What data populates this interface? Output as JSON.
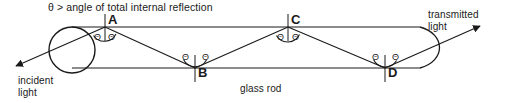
{
  "figure": {
    "title_caption": "θ > angle of total internal reflection",
    "labels": {
      "incident_line1": "incident",
      "incident_line2": "light",
      "transmitted_line1": "transmitted",
      "transmitted_line2": "light",
      "glass_rod": "glass rod"
    },
    "points": [
      {
        "id": "A",
        "label": "A",
        "x": 105,
        "y": 27,
        "surface": "top"
      },
      {
        "id": "B",
        "label": "B",
        "x": 195,
        "y": 68,
        "surface": "bottom"
      },
      {
        "id": "C",
        "label": "C",
        "x": 288,
        "y": 27,
        "surface": "top"
      },
      {
        "id": "D",
        "label": "D",
        "x": 385,
        "y": 68,
        "surface": "bottom"
      }
    ],
    "angle_symbol": "Θ",
    "angle_marks": [
      {
        "at": "A",
        "side": "left"
      },
      {
        "at": "A",
        "side": "right"
      },
      {
        "at": "B",
        "side": "left"
      },
      {
        "at": "B",
        "side": "right"
      },
      {
        "at": "C",
        "side": "left"
      },
      {
        "at": "C",
        "side": "right"
      },
      {
        "at": "D",
        "side": "left"
      },
      {
        "at": "D",
        "side": "right"
      }
    ],
    "colors": {
      "stroke": "#1a1a1a",
      "background": "#ffffff",
      "text": "#1a1a1a"
    },
    "rod": {
      "top_y": 27,
      "bottom_y": 68,
      "left_cap": "rounded-circular-end",
      "right_cap": "convex-curved-end"
    },
    "rays": {
      "incident_arrow": "arrowhead-down-left",
      "transmitted_arrow": "arrowhead-up-right"
    }
  }
}
